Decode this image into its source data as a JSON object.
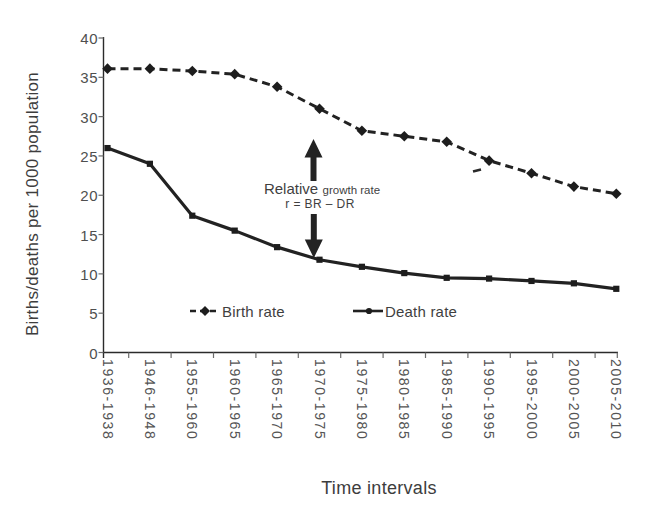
{
  "chart_data": {
    "type": "line",
    "title": "",
    "xlabel": "Time intervals",
    "ylabel": "Births/deaths per 1000 population",
    "ylim": [
      0,
      40
    ],
    "yticks": [
      0,
      5,
      10,
      15,
      20,
      25,
      30,
      35,
      40
    ],
    "grid": false,
    "legend_position": "inside-bottom",
    "categories": [
      "1936-1938",
      "1946-1948",
      "1955-1960",
      "1960-1965",
      "1965-1970",
      "1970-1975",
      "1975-1980",
      "1980-1985",
      "1985-1990",
      "1990-1995",
      "1995-2000",
      "2000-2005",
      "2005-2010"
    ],
    "series": [
      {
        "name": "Birth rate",
        "style": "dashed",
        "marker": "diamond",
        "values": [
          36.1,
          36.1,
          35.8,
          35.4,
          33.8,
          31.0,
          28.2,
          27.5,
          26.8,
          24.4,
          22.8,
          21.1,
          20.2
        ]
      },
      {
        "name": "Death rate",
        "style": "solid",
        "marker": "square",
        "values": [
          26.0,
          24.0,
          17.4,
          15.5,
          13.4,
          11.8,
          10.9,
          10.1,
          9.5,
          9.4,
          9.1,
          8.8,
          8.1
        ]
      }
    ],
    "colors": {
      "ink": "#222222",
      "text": "#4f4f4f",
      "background": "#ffffff"
    }
  },
  "annotation": {
    "line1_large": "Relative",
    "line1_small": "growth rate",
    "line2": "r = BR – DR"
  }
}
